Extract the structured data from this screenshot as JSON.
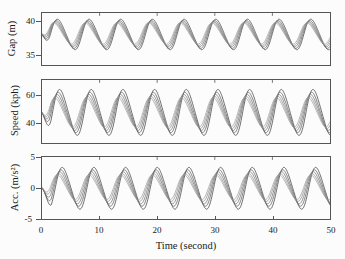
{
  "figure": {
    "partial_header_text": "",
    "xlabel": "Time (second)",
    "xticks": [
      "0",
      "10",
      "20",
      "30",
      "40",
      "50"
    ],
    "colors": {
      "axis": "#555555",
      "line_dark": "#3c3c3c",
      "line_mid": "#6e6e6e",
      "line_light": "#9a9a9a",
      "background": "#fcfcfc"
    }
  },
  "panels": {
    "gap": {
      "ylabel": "Gap (m)",
      "yticks": [
        "40",
        "35"
      ]
    },
    "speed": {
      "ylabel": "Speed (kph)",
      "yticks": [
        "60",
        "40"
      ]
    },
    "acc": {
      "ylabel": "Acc. (m/s²)",
      "yticks": [
        "5",
        "0",
        "-5"
      ]
    }
  },
  "chart_data": {
    "type": "line",
    "title": "",
    "xlabel": "Time (second)",
    "xlim": [
      0,
      50
    ],
    "xticks": [
      0,
      10,
      20,
      30,
      40,
      50
    ],
    "grid": false,
    "legend": "none",
    "subplots": [
      {
        "name": "gap",
        "ylabel": "Gap (m)",
        "ylim": [
          33.2,
          41.2
        ],
        "yticks": [
          40,
          35
        ],
        "description": "Five overlapping oscillating vehicle-gap trajectories, period about 5.5 s, slight phase spread between traces.",
        "series": [
          {
            "name": "veh-1",
            "amplitude": 2.3,
            "mean": 37.9,
            "period": 5.5,
            "phase_deg": 95,
            "color": "#3c3c3c"
          },
          {
            "name": "veh-2",
            "amplitude": 2.1,
            "mean": 37.9,
            "period": 5.5,
            "phase_deg": 83,
            "color": "#5a5a5a"
          },
          {
            "name": "veh-3",
            "amplitude": 1.9,
            "mean": 37.95,
            "period": 5.5,
            "phase_deg": 72,
            "color": "#6e6e6e"
          },
          {
            "name": "veh-4",
            "amplitude": 1.75,
            "mean": 38.0,
            "period": 5.5,
            "phase_deg": 62,
            "color": "#8a8a8a"
          },
          {
            "name": "veh-5",
            "amplitude": 1.6,
            "mean": 38.05,
            "period": 5.5,
            "phase_deg": 52,
            "color": "#9a9a9a"
          }
        ],
        "peak_value": 40.2,
        "trough_value": 35.6
      },
      {
        "name": "speed",
        "ylabel": "Speed (kph)",
        "ylim": [
          33,
          68
        ],
        "yticks": [
          60,
          40
        ],
        "description": "Five overlapping speed oscillations about 50 kph, period about 5.5 s, amplitude spread roughly 8 to 13 kph.",
        "series": [
          {
            "name": "veh-1",
            "amplitude": 12.5,
            "mean": 50.0,
            "period": 5.5,
            "phase_deg": 120,
            "color": "#3c3c3c"
          },
          {
            "name": "veh-2",
            "amplitude": 11.0,
            "mean": 50.0,
            "period": 5.5,
            "phase_deg": 105,
            "color": "#5a5a5a"
          },
          {
            "name": "veh-3",
            "amplitude": 9.8,
            "mean": 50.0,
            "period": 5.5,
            "phase_deg": 92,
            "color": "#6e6e6e"
          },
          {
            "name": "veh-4",
            "amplitude": 8.8,
            "mean": 50.0,
            "period": 5.5,
            "phase_deg": 79,
            "color": "#8a8a8a"
          },
          {
            "name": "veh-5",
            "amplitude": 8.0,
            "mean": 50.0,
            "period": 5.5,
            "phase_deg": 66,
            "color": "#9a9a9a"
          }
        ],
        "peak_value": 62.5,
        "trough_value": 38.0
      },
      {
        "name": "acc",
        "ylabel": "Acc. (m/s²)",
        "ylim": [
          -6.2,
          5.6
        ],
        "yticks": [
          5,
          0,
          -5
        ],
        "description": "Five overlapping acceleration oscillations about zero, period about 5.5 s, peaks near +3.3 and troughs near -4.2 m/s^2.",
        "series": [
          {
            "name": "veh-1",
            "amplitude": 3.9,
            "mean": -0.35,
            "period": 5.5,
            "phase_deg": 150,
            "color": "#3c3c3c"
          },
          {
            "name": "veh-2",
            "amplitude": 3.4,
            "mean": -0.3,
            "period": 5.5,
            "phase_deg": 136,
            "color": "#5a5a5a"
          },
          {
            "name": "veh-3",
            "amplitude": 3.0,
            "mean": -0.25,
            "period": 5.5,
            "phase_deg": 122,
            "color": "#6e6e6e"
          },
          {
            "name": "veh-4",
            "amplitude": 2.6,
            "mean": -0.2,
            "period": 5.5,
            "phase_deg": 108,
            "color": "#8a8a8a"
          },
          {
            "name": "veh-5",
            "amplitude": 2.3,
            "mean": -0.15,
            "period": 5.5,
            "phase_deg": 95,
            "color": "#9a9a9a"
          }
        ],
        "peak_value": 3.3,
        "trough_value": -4.2
      }
    ]
  }
}
